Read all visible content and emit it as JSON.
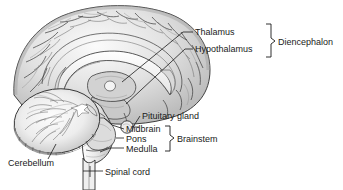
{
  "figure": {
    "background_color": "#ffffff",
    "line_color": "#1a1a1a",
    "tissue_light": "#f2f2f2",
    "tissue_mid": "#d4d4d4",
    "tissue_dark": "#a9a9a9",
    "tissue_darker": "#8d8d8d"
  },
  "labels": {
    "thalamus": "Thalamus",
    "hypothalamus": "Hypothalamus",
    "diencephalon": "Diencephalon",
    "pituitary_gland": "Pituitary gland",
    "midbrain": "Midbrain",
    "pons": "Pons",
    "medulla": "Medulla",
    "brainstem": "Brainstem",
    "cerebellum": "Cerebellum",
    "spinal_cord": "Spinal cord"
  },
  "groups": [
    {
      "name": "Diencephalon",
      "members": [
        "Thalamus",
        "Hypothalamus"
      ]
    },
    {
      "name": "Brainstem",
      "members": [
        "Midbrain",
        "Pons",
        "Medulla"
      ]
    }
  ],
  "structures": [
    "cerebrum",
    "corpus-callosum",
    "thalamus",
    "hypothalamus",
    "pituitary-gland",
    "midbrain",
    "pons",
    "medulla",
    "cerebellum",
    "spinal-cord"
  ]
}
